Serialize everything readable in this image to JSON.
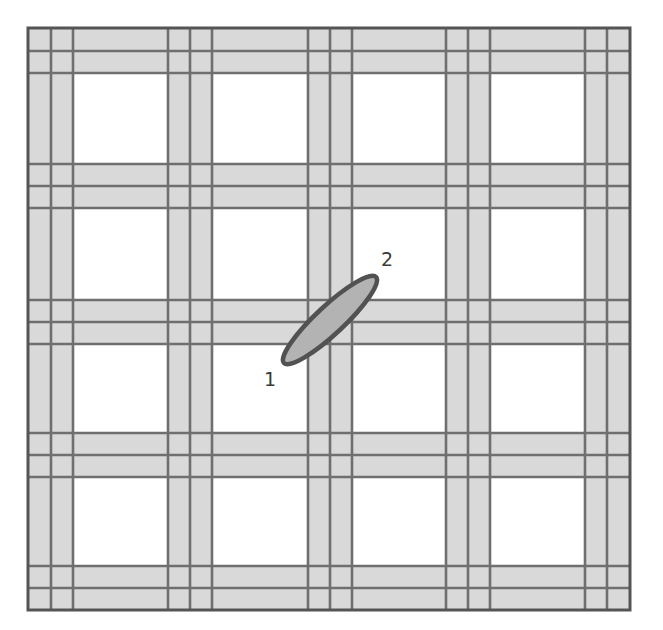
{
  "diagram": {
    "type": "grid-plan-with-ellipse",
    "canvas": {
      "width": 663,
      "height": 630
    },
    "outer_frame": {
      "x": 28,
      "y": 28,
      "width": 602,
      "height": 582
    },
    "band_centers_x": [
      51,
      190,
      330,
      468,
      607
    ],
    "band_centers_y": [
      51,
      186,
      322,
      455,
      588
    ],
    "band_half_width": 22,
    "colors": {
      "background": "#ffffff",
      "band_fill": "#d9d9d9",
      "line": "#6f6f6f",
      "frame": "#555555",
      "ellipse_fill": "#b3b3b3",
      "ellipse_stroke": "#525252"
    },
    "ellipse": {
      "cx": 330,
      "cy": 320,
      "rx": 63,
      "ry": 14,
      "rotation_deg": -43
    },
    "labels": [
      {
        "id": "point-1",
        "text": "1",
        "x": 264,
        "y": 370
      },
      {
        "id": "point-2",
        "text": "2",
        "x": 381,
        "y": 250
      }
    ]
  }
}
